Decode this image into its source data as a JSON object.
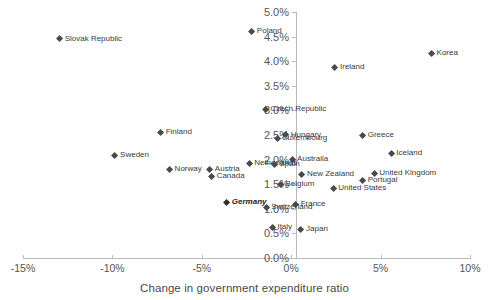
{
  "chart_data": {
    "type": "scatter",
    "title": "",
    "xlabel": "Change in government expenditure ratio",
    "ylabel": "",
    "xlim": [
      -15,
      10
    ],
    "ylim": [
      0.0,
      5.0
    ],
    "xticks": [
      "-15%",
      "-10%",
      "-5%",
      "0%",
      "5%",
      "10%"
    ],
    "xtickvalues": [
      -15,
      -10,
      -5,
      0,
      5,
      10
    ],
    "yticks": [
      "0.0%",
      "0.5%",
      "1.0%",
      "1.5%",
      "2.0%",
      "2.5%",
      "3.0%",
      "3.5%",
      "4.0%",
      "4.5%",
      "5.0%"
    ],
    "ytickvalues": [
      0.0,
      0.5,
      1.0,
      1.5,
      2.0,
      2.5,
      3.0,
      3.5,
      4.0,
      4.5,
      5.0
    ],
    "grid": false,
    "legend": false,
    "marker": "diamond",
    "marker_color": "#4a4a4a",
    "points": [
      {
        "label": "Slovak Republic",
        "x": -12.95,
        "y": 4.45,
        "highlight": false
      },
      {
        "label": "Poland",
        "x": -2.2,
        "y": 4.6,
        "highlight": false
      },
      {
        "label": "Korea",
        "x": 7.85,
        "y": 4.15,
        "highlight": false
      },
      {
        "label": "Ireland",
        "x": 2.45,
        "y": 3.87,
        "highlight": false
      },
      {
        "label": "Czech Republic",
        "x": -1.45,
        "y": 3.02,
        "highlight": false
      },
      {
        "label": "Finland",
        "x": -7.3,
        "y": 2.55,
        "highlight": false
      },
      {
        "label": "Hungary",
        "x": -0.3,
        "y": 2.5,
        "highlight": false
      },
      {
        "label": "Luxembourg",
        "x": -0.75,
        "y": 2.42,
        "highlight": false
      },
      {
        "label": "Greece",
        "x": 4.0,
        "y": 2.48,
        "highlight": false
      },
      {
        "label": "Iceland",
        "x": 5.6,
        "y": 2.12,
        "highlight": false
      },
      {
        "label": "Sweden",
        "x": -9.85,
        "y": 2.08,
        "highlight": false
      },
      {
        "label": "Australia",
        "x": 0.05,
        "y": 2.0,
        "highlight": false
      },
      {
        "label": "Netherlands",
        "x": -2.35,
        "y": 1.92,
        "highlight": false
      },
      {
        "label": "Spain",
        "x": -0.95,
        "y": 1.9,
        "highlight": false
      },
      {
        "label": "Norway",
        "x": -6.8,
        "y": 1.79,
        "highlight": false
      },
      {
        "label": "Austria",
        "x": -4.55,
        "y": 1.79,
        "highlight": false
      },
      {
        "label": "New Zealand",
        "x": 0.6,
        "y": 1.7,
        "highlight": false
      },
      {
        "label": "United Kingdom",
        "x": 4.65,
        "y": 1.72,
        "highlight": false
      },
      {
        "label": "Canada",
        "x": -4.45,
        "y": 1.66,
        "highlight": false
      },
      {
        "label": "Portugal",
        "x": 4.0,
        "y": 1.58,
        "highlight": false
      },
      {
        "label": "Belgium",
        "x": -0.6,
        "y": 1.5,
        "highlight": false
      },
      {
        "label": "United States",
        "x": 2.35,
        "y": 1.42,
        "highlight": false
      },
      {
        "label": "Germany",
        "x": -3.6,
        "y": 1.12,
        "highlight": true
      },
      {
        "label": "France",
        "x": 0.25,
        "y": 1.09,
        "highlight": false
      },
      {
        "label": "Switzerland",
        "x": -1.4,
        "y": 1.03,
        "highlight": false
      },
      {
        "label": "Italy",
        "x": -1.05,
        "y": 0.61,
        "highlight": false
      },
      {
        "label": "Japan",
        "x": 0.55,
        "y": 0.57,
        "highlight": false
      }
    ]
  }
}
